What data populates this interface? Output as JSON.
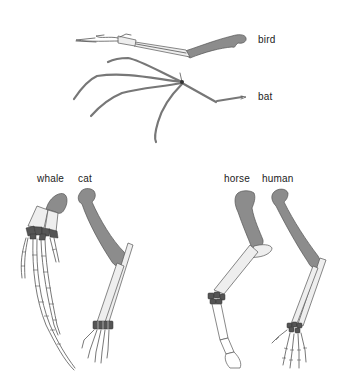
{
  "diagram": {
    "type": "homologous-forelimbs",
    "colors": {
      "humerus": "#8c8c8c",
      "outline": "#555555",
      "light_bone": "#eeeeee",
      "carpals": "#555555",
      "background": "#ffffff"
    },
    "specimens": [
      {
        "id": "bird",
        "label": "bird"
      },
      {
        "id": "bat",
        "label": "bat"
      },
      {
        "id": "whale",
        "label": "whale"
      },
      {
        "id": "cat",
        "label": "cat"
      },
      {
        "id": "horse",
        "label": "horse"
      },
      {
        "id": "human",
        "label": "human"
      }
    ]
  }
}
